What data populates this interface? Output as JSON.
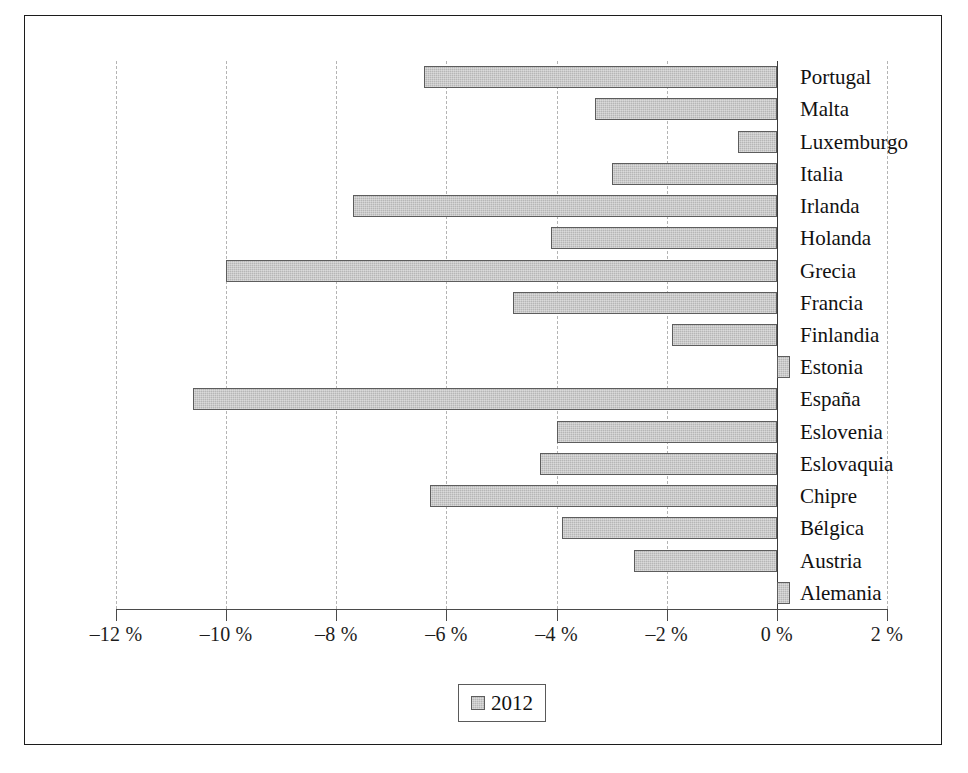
{
  "chart_data": {
    "type": "bar",
    "orientation": "horizontal",
    "title": "",
    "subtitle": "",
    "xlabel": "",
    "ylabel": "",
    "xlim": [
      -12,
      2
    ],
    "xticks": [
      -12,
      -10,
      -8,
      -6,
      -4,
      -2,
      0,
      2
    ],
    "xtick_labels": [
      "–12 %",
      "–10 %",
      "–8 %",
      "–6 %",
      "–4 %",
      "–2 %",
      "0 %",
      "2 %"
    ],
    "grid": "vertical-dashed",
    "legend": {
      "position": "bottom-center",
      "entries": [
        {
          "label": "2012",
          "color": "#b6b6b6"
        }
      ]
    },
    "categories": [
      "Portugal",
      "Malta",
      "Luxemburgo",
      "Italia",
      "Irlanda",
      "Holanda",
      "Grecia",
      "Francia",
      "Finlandia",
      "Estonia",
      "España",
      "Eslovenia",
      "Eslovaquia",
      "Chipre",
      "Bélgica",
      "Austria",
      "Alemania"
    ],
    "series": [
      {
        "name": "2012",
        "values": [
          -6.4,
          -3.3,
          -0.7,
          -3.0,
          -7.7,
          -4.1,
          -10.0,
          -4.8,
          -1.9,
          0.2,
          -10.6,
          -4.0,
          -4.3,
          -6.3,
          -3.9,
          -2.6,
          0.2
        ]
      }
    ]
  },
  "legend": {
    "label": "2012"
  }
}
